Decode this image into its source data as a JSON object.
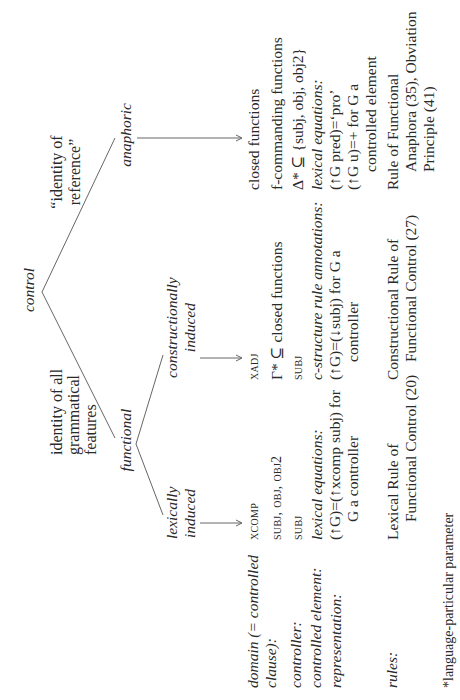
{
  "tree": {
    "root": "control",
    "root_branches": [
      {
        "gloss": "“identity of reference”",
        "gloss_lines": [
          "“identity of",
          "reference”"
        ],
        "label": "anaphoric"
      },
      {
        "gloss": "identity of all grammatical features",
        "gloss_lines": [
          "identity of all",
          "grammatical",
          "features"
        ],
        "label": "functional"
      }
    ],
    "functional_branches": [
      {
        "label_lines": [
          "lexically",
          "induced"
        ]
      },
      {
        "label_lines": [
          "constructionally",
          "induced"
        ]
      }
    ]
  },
  "row_labels": {
    "domain": [
      "domain (= controlled",
      "clause):"
    ],
    "controller": "controller:",
    "controlled_element": "controlled element:",
    "representation": "representation:",
    "rules": "rules:"
  },
  "columns": {
    "lexically_induced": {
      "domain": "xcomp",
      "controller": "subj, obj, obj2",
      "controlled_element": "subj",
      "representation_heading": "lexical equations:",
      "representation_lines": [
        "(↑G)=(↑xcomp subj) for",
        "G a controller"
      ],
      "rules_lines": [
        "Lexical Rule of",
        "Functional Control (20)"
      ]
    },
    "constructionally_induced": {
      "domain": "xadj",
      "controller": "Γ* ⊆ closed functions",
      "controlled_element": "subj",
      "representation_heading": "c-structure rule annotations:",
      "representation_lines": [
        "(↑G)=(↓subj) for G a",
        "controller"
      ],
      "rules_lines": [
        "Constructional Rule of",
        "Functional Control (27)"
      ]
    },
    "anaphoric": {
      "domain": "closed functions",
      "controller": "f-commanding functions",
      "controlled_element": "Δ* ⊆ {subj, obj, obj2}",
      "representation_heading": "lexical equations:",
      "representation_lines": [
        "(↑G pred)=‘pro’",
        "(↑G u)=+ for G a",
        "controlled element"
      ],
      "rules_lines": [
        "Rule of Functional",
        "Anaphora (35), Obviation",
        "Principle (41)"
      ]
    }
  },
  "footnote": "*language-particular parameter"
}
